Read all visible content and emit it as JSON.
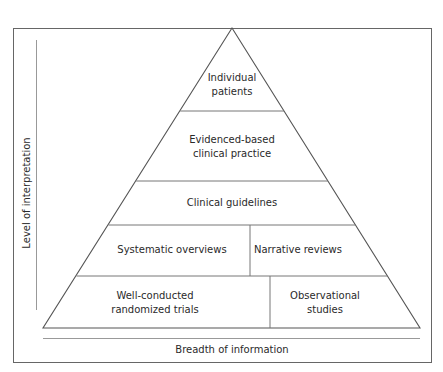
{
  "diagram": {
    "type": "evidence-pyramid",
    "axes": {
      "y_label": "Level of interpretation",
      "x_label": "Breadth of information"
    },
    "tiers": [
      {
        "level": 1,
        "cells": [
          {
            "label_lines": [
              "Individual",
              "patients"
            ]
          }
        ]
      },
      {
        "level": 2,
        "cells": [
          {
            "label_lines": [
              "Evidenced-based",
              "clinical practice"
            ]
          }
        ]
      },
      {
        "level": 3,
        "cells": [
          {
            "label_lines": [
              "Clinical guidelines"
            ]
          }
        ]
      },
      {
        "level": 4,
        "cells": [
          {
            "label_lines": [
              "Systematic overviews"
            ]
          },
          {
            "label_lines": [
              "Narrative reviews"
            ]
          }
        ]
      },
      {
        "level": 5,
        "cells": [
          {
            "label_lines": [
              "Well-conducted",
              "randomized trials"
            ]
          },
          {
            "label_lines": [
              "Observational",
              "studies"
            ]
          }
        ]
      }
    ],
    "colors": {
      "line": "#555555",
      "axis": "#888888",
      "text": "#2a2a2a",
      "background": "#ffffff"
    }
  }
}
